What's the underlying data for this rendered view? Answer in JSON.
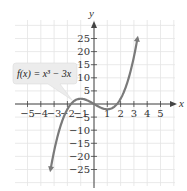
{
  "chart_data": {
    "type": "line",
    "title": "",
    "xlabel": "x",
    "ylabel": "y",
    "xlim": [
      -5.5,
      5.5
    ],
    "ylim": [
      -30,
      30
    ],
    "grid": true,
    "x_ticks": [
      -5,
      -4,
      -3,
      -2,
      -1,
      1,
      2,
      3,
      4,
      5
    ],
    "y_ticks": [
      25,
      20,
      15,
      10,
      5,
      -5,
      -10,
      -15,
      -20,
      -25
    ],
    "x_tick_labels": [
      "-5",
      "-4",
      "-3",
      "-2",
      "-1",
      "1",
      "2",
      "3",
      "4",
      "5"
    ],
    "y_tick_labels": [
      "25",
      "20",
      "15",
      "10",
      "5",
      "-5",
      "-10",
      "-15",
      "-20",
      "-25"
    ],
    "series": [
      {
        "name": "f(x) = x^3 - 3x",
        "function": "x^3 - 3x",
        "domain": [
          -3.3,
          3.3
        ],
        "color": "#7a7a7a",
        "x": [
          -3.2,
          -3,
          -2.5,
          -2,
          -1.5,
          -1,
          -0.5,
          0,
          0.5,
          1,
          1.5,
          2,
          2.5,
          3,
          3.2
        ],
        "values": [
          -23.17,
          -18,
          -8.13,
          -2,
          1.13,
          2,
          1.38,
          0,
          -1.38,
          -2,
          -1.13,
          2,
          8.13,
          18,
          23.17
        ]
      }
    ],
    "annotations": [
      {
        "text": "f(x) = x³ − 3x",
        "points_to": [
          -1.7,
          0.8
        ]
      }
    ]
  },
  "labels": {
    "x_axis": "x",
    "y_axis": "y",
    "callout": "f(x) = x³ − 3x"
  },
  "colors": {
    "grid": "#e4e4e4",
    "axis": "#444444",
    "curve": "#7a7a7a",
    "callout_bg": "#ececec"
  }
}
